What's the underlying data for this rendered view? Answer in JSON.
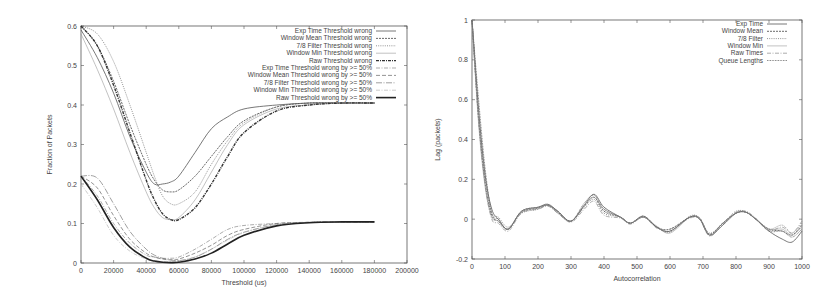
{
  "chart_data": [
    {
      "type": "line",
      "title": "",
      "xlabel": "Threshold (us)",
      "ylabel": "Fraction of Packets",
      "xlim": [
        0,
        200000
      ],
      "ylim": [
        0,
        0.6
      ],
      "xticks": [
        "0",
        "20000",
        "40000",
        "60000",
        "80000",
        "100000",
        "120000",
        "140000",
        "160000",
        "180000",
        "200000"
      ],
      "yticks": [
        "0",
        "0.1",
        "0.2",
        "0.3",
        "0.4",
        "0.5",
        "0.6"
      ],
      "grid": false,
      "legend_position": "top-right",
      "x": [
        0,
        10000,
        20000,
        30000,
        40000,
        45000,
        50000,
        55000,
        60000,
        70000,
        80000,
        90000,
        100000,
        120000,
        140000,
        160000,
        180000
      ],
      "series": [
        {
          "name": "Exp Time Threshold wrong",
          "style": "solid",
          "values": [
            0.59,
            0.52,
            0.43,
            0.32,
            0.23,
            0.2,
            0.2,
            0.205,
            0.22,
            0.28,
            0.34,
            0.37,
            0.39,
            0.4,
            0.405,
            0.405,
            0.405
          ]
        },
        {
          "name": "Window Mean Threshold wrong",
          "style": "dashed-fine",
          "values": [
            0.6,
            0.55,
            0.46,
            0.35,
            0.25,
            0.21,
            0.185,
            0.18,
            0.185,
            0.22,
            0.27,
            0.32,
            0.36,
            0.395,
            0.405,
            0.405,
            0.405
          ]
        },
        {
          "name": "7/8 Filter Threshold wrong",
          "style": "dotted",
          "values": [
            0.6,
            0.58,
            0.51,
            0.4,
            0.28,
            0.22,
            0.17,
            0.15,
            0.15,
            0.18,
            0.25,
            0.31,
            0.355,
            0.395,
            0.405,
            0.405,
            0.405
          ]
        },
        {
          "name": "Window Min Threshold wrong",
          "style": "solid-light",
          "values": [
            0.58,
            0.49,
            0.39,
            0.28,
            0.18,
            0.14,
            0.115,
            0.11,
            0.115,
            0.16,
            0.23,
            0.3,
            0.35,
            0.39,
            0.4,
            0.405,
            0.405
          ]
        },
        {
          "name": "Raw Threshold wrong",
          "style": "dash-dot-bold",
          "values": [
            0.6,
            0.55,
            0.45,
            0.33,
            0.21,
            0.16,
            0.125,
            0.11,
            0.11,
            0.14,
            0.2,
            0.27,
            0.33,
            0.385,
            0.4,
            0.405,
            0.405
          ]
        },
        {
          "name": "Exp Time Threshold wrong by >= 50%",
          "style": "dash-dot",
          "values": [
            0.22,
            0.17,
            0.1,
            0.05,
            0.02,
            0.015,
            0.012,
            0.012,
            0.015,
            0.035,
            0.06,
            0.085,
            0.095,
            0.1,
            0.103,
            0.104,
            0.104
          ]
        },
        {
          "name": "Window Mean Threshold wrong by >= 50%",
          "style": "dashed",
          "values": [
            0.22,
            0.19,
            0.12,
            0.06,
            0.025,
            0.015,
            0.01,
            0.008,
            0.01,
            0.025,
            0.045,
            0.07,
            0.085,
            0.1,
            0.103,
            0.104,
            0.104
          ]
        },
        {
          "name": "7/8 Filter Threshold wrong by >= 50%",
          "style": "long-dash-dot",
          "values": [
            0.22,
            0.215,
            0.15,
            0.08,
            0.035,
            0.02,
            0.012,
            0.008,
            0.006,
            0.015,
            0.035,
            0.06,
            0.078,
            0.097,
            0.103,
            0.104,
            0.104
          ]
        },
        {
          "name": "Window Min Threshold wrong by >= 50%",
          "style": "dash-dot-light",
          "values": [
            0.2,
            0.14,
            0.07,
            0.03,
            0.01,
            0.005,
            0.004,
            0.004,
            0.005,
            0.015,
            0.035,
            0.058,
            0.077,
            0.097,
            0.103,
            0.104,
            0.104
          ]
        },
        {
          "name": "Raw Threshold wrong by >= 50%",
          "style": "solid-bold",
          "values": [
            0.22,
            0.16,
            0.09,
            0.04,
            0.012,
            0.005,
            0.002,
            0.001,
            0.002,
            0.01,
            0.025,
            0.048,
            0.07,
            0.094,
            0.102,
            0.104,
            0.104
          ]
        }
      ]
    },
    {
      "type": "line",
      "title": "",
      "xlabel": "Autocorrelation",
      "ylabel": "Lag (packets)",
      "xlim": [
        0,
        1000
      ],
      "ylim": [
        -0.2,
        1
      ],
      "xticks": [
        "0",
        "100",
        "200",
        "300",
        "400",
        "500",
        "600",
        "700",
        "800",
        "900",
        "1000"
      ],
      "yticks": [
        "-0.2",
        "0",
        "0.2",
        "0.4",
        "0.6",
        "0.8",
        "1"
      ],
      "grid": false,
      "legend_position": "top-right",
      "x": [
        0,
        20,
        40,
        60,
        80,
        110,
        150,
        200,
        230,
        260,
        300,
        340,
        370,
        400,
        450,
        480,
        520,
        560,
        600,
        660,
        690,
        720,
        760,
        800,
        830,
        860,
        900,
        940,
        970,
        1000
      ],
      "series": [
        {
          "name": "Exp Time",
          "style": "solid",
          "values": [
            1.0,
            0.55,
            0.22,
            0.05,
            0.0,
            -0.05,
            0.04,
            0.06,
            0.075,
            0.04,
            -0.01,
            0.07,
            0.125,
            0.06,
            0.01,
            -0.02,
            0.01,
            -0.04,
            -0.06,
            0.01,
            0.0,
            -0.08,
            -0.03,
            0.03,
            0.035,
            0.0,
            -0.06,
            -0.1,
            -0.115,
            -0.06
          ]
        },
        {
          "name": "Window Mean",
          "style": "dashed-fine",
          "values": [
            1.0,
            0.5,
            0.18,
            0.02,
            -0.01,
            -0.05,
            0.035,
            0.055,
            0.07,
            0.035,
            -0.01,
            0.065,
            0.11,
            0.04,
            0.01,
            -0.02,
            0.015,
            -0.04,
            -0.05,
            0.01,
            0.005,
            -0.075,
            -0.02,
            0.03,
            0.035,
            0.0,
            -0.05,
            -0.06,
            -0.08,
            -0.03
          ]
        },
        {
          "name": "7/8 Filter",
          "style": "dotted",
          "values": [
            1.0,
            0.52,
            0.2,
            0.03,
            0.01,
            -0.04,
            0.03,
            0.05,
            0.07,
            0.04,
            -0.01,
            0.06,
            0.1,
            0.03,
            0.01,
            -0.02,
            0.015,
            -0.04,
            -0.065,
            0.015,
            0.005,
            -0.07,
            -0.02,
            0.04,
            0.035,
            0.0,
            -0.05,
            -0.03,
            -0.07,
            -0.02
          ]
        },
        {
          "name": "Window Min",
          "style": "solid-light",
          "values": [
            1.0,
            0.48,
            0.16,
            0.01,
            -0.01,
            -0.05,
            0.035,
            0.055,
            0.07,
            0.03,
            -0.01,
            0.07,
            0.11,
            0.05,
            0.01,
            -0.02,
            0.01,
            -0.035,
            -0.07,
            0.01,
            0.005,
            -0.08,
            -0.02,
            0.03,
            0.035,
            0.0,
            -0.05,
            -0.05,
            -0.08,
            -0.04
          ]
        },
        {
          "name": "Raw Times",
          "style": "dash-dot",
          "values": [
            1.0,
            0.5,
            0.17,
            0.0,
            -0.02,
            -0.06,
            0.03,
            0.05,
            0.065,
            0.03,
            -0.015,
            0.05,
            0.09,
            0.02,
            0.005,
            -0.025,
            0.01,
            -0.045,
            -0.05,
            0.005,
            0.0,
            -0.085,
            -0.025,
            0.035,
            0.04,
            0.005,
            -0.055,
            -0.04,
            -0.07,
            -0.01
          ]
        },
        {
          "name": "Queue Lengths",
          "style": "dotted-dense",
          "values": [
            1.0,
            0.6,
            0.25,
            0.03,
            0.0,
            -0.05,
            0.04,
            0.06,
            0.07,
            0.04,
            -0.01,
            0.08,
            0.12,
            0.05,
            0.01,
            -0.02,
            0.015,
            -0.04,
            -0.06,
            0.01,
            0.0,
            -0.08,
            -0.02,
            0.03,
            0.035,
            0.0,
            -0.06,
            -0.06,
            -0.09,
            -0.05
          ]
        }
      ]
    }
  ],
  "style": {
    "axis_color": "#555555",
    "text_color": "#444444",
    "series_colors": [
      "#555555",
      "#444444",
      "#777777",
      "#999999",
      "#333333",
      "#888888",
      "#666666",
      "#777777",
      "#999999",
      "#222222"
    ]
  }
}
